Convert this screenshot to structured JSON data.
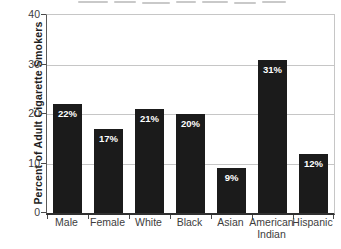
{
  "chart_data": {
    "type": "bar",
    "categories": [
      "Male",
      "Female",
      "White",
      "Black",
      "Asian",
      "American Indian",
      "Hispanic"
    ],
    "values": [
      22,
      17,
      21,
      20,
      9,
      31,
      12
    ],
    "value_labels": [
      "22%",
      "17%",
      "21%",
      "20%",
      "9%",
      "31%",
      "12%"
    ],
    "title": "",
    "xlabel": "",
    "ylabel": "Percent of Adult Cigarette Smokers",
    "ylim": [
      0,
      40
    ],
    "yticks": [
      0,
      10,
      20,
      30,
      40
    ],
    "grid": "horizontal",
    "legend": "none",
    "bar_color": "#1b1b1b",
    "value_label_color": "#ffffff",
    "gridline_color": "#c6c6c6",
    "axis_color": "#4a4a4a",
    "text_color": "#3d3d3d"
  }
}
